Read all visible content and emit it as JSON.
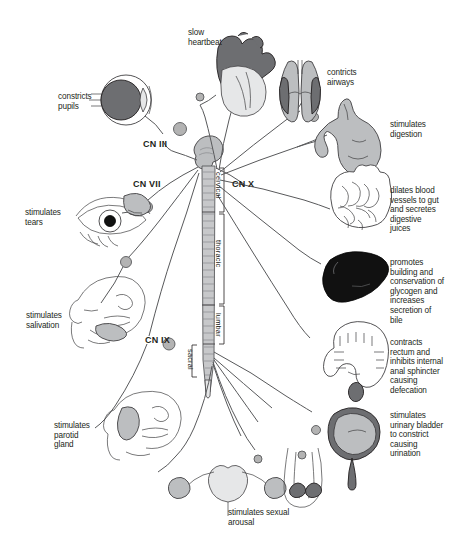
{
  "diagram": {
    "background_color": "#ffffff",
    "text_color": "#231f20",
    "nerve_color": "#58595b"
  },
  "cranial_nerves": [
    {
      "id": "cn3",
      "label": "CN III",
      "x": 143,
      "y": 140
    },
    {
      "id": "cn7",
      "label": "CN VII",
      "x": 133,
      "y": 180
    },
    {
      "id": "cn9",
      "label": "CN IX",
      "x": 145,
      "y": 336
    },
    {
      "id": "cn10",
      "label": "CN X",
      "x": 232,
      "y": 180
    }
  ],
  "spinal_regions": [
    {
      "id": "cervical",
      "label": "cervical",
      "x": 214,
      "y": 188
    },
    {
      "id": "thoracic",
      "label": "thoracic",
      "x": 214,
      "y": 243
    },
    {
      "id": "lumbar",
      "label": "lumbar",
      "x": 214,
      "y": 318
    },
    {
      "id": "sacral",
      "label": "sacral",
      "x": 188,
      "y": 353
    }
  ],
  "targets": [
    {
      "id": "pupils",
      "organ": "eye-cross-section",
      "label": "constricts\npupils",
      "x": 58,
      "y": 92,
      "side": "left"
    },
    {
      "id": "tears",
      "organ": "eye-lacrimal-gland",
      "label": "stimulates\ntears",
      "x": 25,
      "y": 208,
      "side": "left"
    },
    {
      "id": "salivation",
      "organ": "face-submandibular-gland",
      "label": "stimulates\nsalivation",
      "x": 26,
      "y": 311,
      "side": "left"
    },
    {
      "id": "parotid",
      "organ": "face-parotid-gland",
      "label": "stimulates\nparotid\ngland",
      "x": 54,
      "y": 421,
      "side": "left"
    },
    {
      "id": "heart",
      "organ": "heart",
      "label": "slow\nheartbeat",
      "x": 188,
      "y": 28,
      "side": "top"
    },
    {
      "id": "lungs",
      "organ": "lungs",
      "label": "contricts\nairways",
      "x": 327,
      "y": 68,
      "side": "right"
    },
    {
      "id": "stomach",
      "organ": "stomach",
      "label": "stimulates\ndigestion",
      "x": 390,
      "y": 120,
      "side": "right"
    },
    {
      "id": "intestines",
      "organ": "small-intestine",
      "label": "dilates blood\nvessels to gut\nand secretes\ndigestive\njuices",
      "x": 390,
      "y": 186,
      "side": "right"
    },
    {
      "id": "liver",
      "organ": "liver",
      "label": "promotes\nbuilding and\nconservation of\nglycogen and\nincreases\nsecretion of\nbile",
      "x": 390,
      "y": 258,
      "side": "right"
    },
    {
      "id": "colon",
      "organ": "large-intestine",
      "label": "contracts\nrectum and\ninhibits internal\nanal sphincter\ncausing\ndefecation",
      "x": 390,
      "y": 338,
      "side": "right"
    },
    {
      "id": "bladder",
      "organ": "urinary-bladder",
      "label": "stimulates\nurinary bladder\nto constrict\ncausing\nurination",
      "x": 390,
      "y": 411,
      "side": "right"
    },
    {
      "id": "genitals",
      "organ": "reproductive-organs",
      "label": "stimulates sexual\narousal",
      "x": 228,
      "y": 508,
      "side": "bottom"
    }
  ]
}
